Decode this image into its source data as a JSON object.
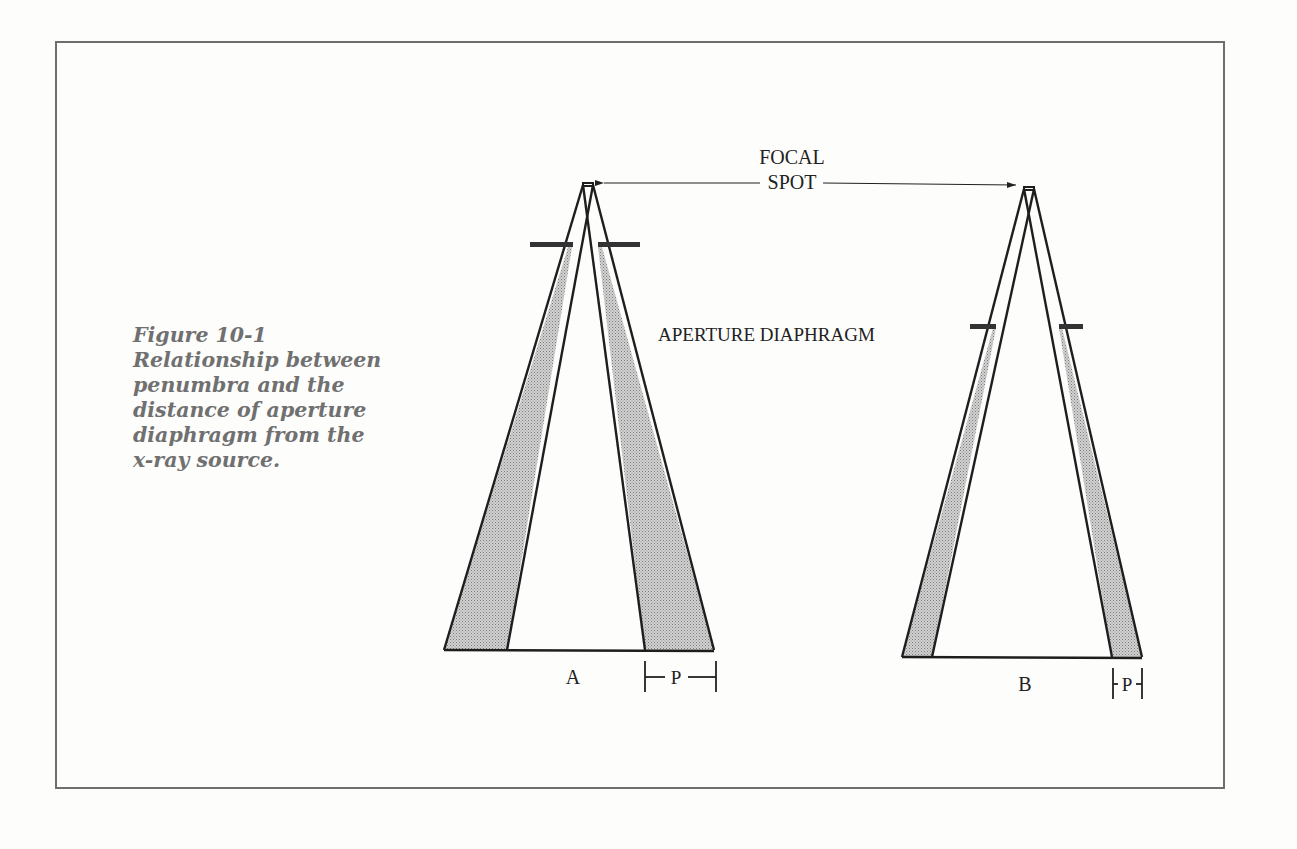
{
  "caption": {
    "figure_number": "Figure 10-1",
    "lines": [
      "Relationship between",
      "penumbra and the",
      "distance of aperture",
      "diaphragm from the",
      "x-ray source."
    ]
  },
  "labels": {
    "focal_spot_line1": "FOCAL",
    "focal_spot_line2": "SPOT",
    "aperture_diaphragm": "APERTURE DIAPHRAGM",
    "diagram_a": "A",
    "diagram_b": "B",
    "penumbra_a": "P",
    "penumbra_b": "P"
  },
  "colors": {
    "frame": "#6e6e6e",
    "caption_text": "#707070",
    "line": "#1e1e1e",
    "penumbra_fill": "#b8b8b8"
  }
}
